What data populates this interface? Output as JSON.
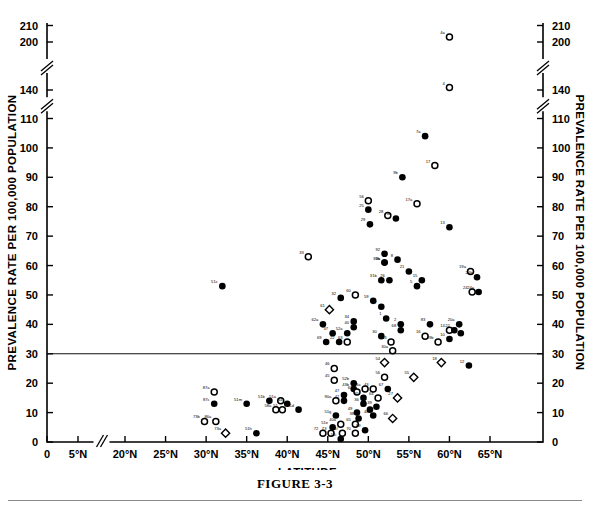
{
  "figure": {
    "caption": "FIGURE 3-3",
    "xlabel": "LATITUDE",
    "ylabel_left": "PREVALENCE RATE PER 100,000 POPULATION",
    "ylabel_right": "PREVALENCE RATE PER 100,000 POPULATION"
  },
  "chart_data": {
    "type": "scatter",
    "title": "FIGURE 3-3",
    "xlabel": "LATITUDE",
    "ylabel": "PREVALENCE RATE PER 100,000 POPULATION",
    "grid": false,
    "legend": null,
    "xtick_labels": [
      "0",
      "5°N",
      "20°N",
      "25°N",
      "30°N",
      "35°N",
      "40°N",
      "45°N",
      "50°N",
      "55°N",
      "60°N",
      "65°N"
    ],
    "xtick_values": [
      0,
      5,
      20,
      25,
      30,
      35,
      40,
      45,
      50,
      55,
      60,
      65
    ],
    "x_axis_break_between": [
      5,
      20
    ],
    "ytick_labels": [
      "0",
      "10",
      "20",
      "30",
      "40",
      "50",
      "60",
      "70",
      "80",
      "90",
      "100",
      "110",
      "140",
      "200",
      "210"
    ],
    "ytick_values": [
      0,
      10,
      20,
      30,
      40,
      50,
      60,
      70,
      80,
      90,
      100,
      110,
      140,
      200,
      210
    ],
    "y_axis_breaks": [
      [
        110,
        140
      ],
      [
        140,
        200
      ]
    ],
    "reference_line_y": 30,
    "marker_types": [
      "filled-circle",
      "open-circle",
      "open-diamond"
    ],
    "points": [
      {
        "label": "4a",
        "x": 60.0,
        "y": 203,
        "m": "open"
      },
      {
        "label": "4",
        "x": 60.0,
        "y": 143,
        "m": "open"
      },
      {
        "label": "7a",
        "x": 57.0,
        "y": 104,
        "m": "filled"
      },
      {
        "label": "17",
        "x": 58.2,
        "y": 94,
        "m": "open"
      },
      {
        "label": "9b",
        "x": 54.2,
        "y": 90,
        "m": "filled"
      },
      {
        "label": "56",
        "x": 50.0,
        "y": 82,
        "m": "open"
      },
      {
        "label": "17a",
        "x": 56.0,
        "y": 81,
        "m": "open"
      },
      {
        "label": "25",
        "x": 50.0,
        "y": 79,
        "m": "filled"
      },
      {
        "label": "28",
        "x": 52.4,
        "y": 77,
        "m": "open"
      },
      {
        "label": "4a",
        "x": 53.4,
        "y": 76,
        "m": "filled"
      },
      {
        "label": "29",
        "x": 50.2,
        "y": 74,
        "m": "filled"
      },
      {
        "label": "13",
        "x": 60.0,
        "y": 73,
        "m": "filled"
      },
      {
        "label": "33",
        "x": 42.6,
        "y": 63,
        "m": "open"
      },
      {
        "label": "9a",
        "x": 52.0,
        "y": 61,
        "m": "filled"
      },
      {
        "label": "30b",
        "x": 52.0,
        "y": 61,
        "m": "filled"
      },
      {
        "label": "92",
        "x": 52.0,
        "y": 64,
        "m": "filled"
      },
      {
        "label": "8",
        "x": 53.6,
        "y": 62,
        "m": "filled"
      },
      {
        "label": "19a",
        "x": 62.6,
        "y": 58,
        "m": "open"
      },
      {
        "label": "21",
        "x": 55.0,
        "y": 58,
        "m": "filled"
      },
      {
        "label": "24b",
        "x": 63.4,
        "y": 56,
        "m": "filled"
      },
      {
        "label": "31b",
        "x": 51.6,
        "y": 55,
        "m": "filled"
      },
      {
        "label": "26",
        "x": 52.6,
        "y": 55,
        "m": "filled"
      },
      {
        "label": "15",
        "x": 56.6,
        "y": 55,
        "m": "filled"
      },
      {
        "label": "5",
        "x": 56.0,
        "y": 53,
        "m": "filled"
      },
      {
        "label": "51c",
        "x": 32.0,
        "y": 53,
        "m": "filled"
      },
      {
        "label": "24",
        "x": 62.8,
        "y": 51,
        "m": "open"
      },
      {
        "label": "24a",
        "x": 63.6,
        "y": 51,
        "m": "filled"
      },
      {
        "label": "32",
        "x": 46.6,
        "y": 49,
        "m": "filled"
      },
      {
        "label": "60",
        "x": 48.4,
        "y": 50,
        "m": "open"
      },
      {
        "label": "59",
        "x": 50.6,
        "y": 48,
        "m": "filled"
      },
      {
        "label": "57",
        "x": 51.6,
        "y": 46,
        "m": "filled"
      },
      {
        "label": "61",
        "x": 45.2,
        "y": 45,
        "m": "dia"
      },
      {
        "label": "1",
        "x": 52.2,
        "y": 42,
        "m": "filled"
      },
      {
        "label": "62a",
        "x": 44.4,
        "y": 40,
        "m": "filled"
      },
      {
        "label": "34",
        "x": 48.2,
        "y": 41,
        "m": "filled"
      },
      {
        "label": "40",
        "x": 48.2,
        "y": 39,
        "m": "filled"
      },
      {
        "label": "2",
        "x": 54.0,
        "y": 40,
        "m": "filled"
      },
      {
        "label": "83",
        "x": 57.6,
        "y": 40,
        "m": "filled"
      },
      {
        "label": "20a",
        "x": 61.2,
        "y": 40,
        "m": "filled"
      },
      {
        "label": "37",
        "x": 45.6,
        "y": 37,
        "m": "filled"
      },
      {
        "label": "52a",
        "x": 47.4,
        "y": 37,
        "m": "filled"
      },
      {
        "label": "68",
        "x": 54.0,
        "y": 38,
        "m": "filled"
      },
      {
        "label": "14",
        "x": 60.0,
        "y": 38,
        "m": "open"
      },
      {
        "label": "22",
        "x": 60.6,
        "y": 38,
        "m": "filled"
      },
      {
        "label": "23",
        "x": 61.4,
        "y": 37,
        "m": "filled"
      },
      {
        "label": "16",
        "x": 57.0,
        "y": 36,
        "m": "open"
      },
      {
        "label": "30",
        "x": 51.6,
        "y": 36,
        "m": "filled"
      },
      {
        "label": "10",
        "x": 60.0,
        "y": 35,
        "m": "filled"
      },
      {
        "label": "53",
        "x": 52.8,
        "y": 34,
        "m": "open"
      },
      {
        "label": "69",
        "x": 44.8,
        "y": 34,
        "m": "filled"
      },
      {
        "label": "22",
        "x": 46.4,
        "y": 34,
        "m": "filled"
      },
      {
        "label": "63",
        "x": 47.4,
        "y": 34,
        "m": "open"
      },
      {
        "label": "19b",
        "x": 58.6,
        "y": 34,
        "m": "open"
      },
      {
        "label": "30a",
        "x": 53.0,
        "y": 31,
        "m": "open"
      },
      {
        "label": "54",
        "x": 52.0,
        "y": 27,
        "m": "dia"
      },
      {
        "label": "18",
        "x": 59.0,
        "y": 27,
        "m": "dia"
      },
      {
        "label": "12",
        "x": 62.4,
        "y": 26,
        "m": "filled"
      },
      {
        "label": "46",
        "x": 45.8,
        "y": 25,
        "m": "open"
      },
      {
        "label": "56",
        "x": 52.0,
        "y": 22,
        "m": "open"
      },
      {
        "label": "55",
        "x": 55.6,
        "y": 22,
        "m": "dia"
      },
      {
        "label": "45",
        "x": 45.8,
        "y": 21,
        "m": "open"
      },
      {
        "label": "52b",
        "x": 48.2,
        "y": 20,
        "m": "filled"
      },
      {
        "label": "43b",
        "x": 48.2,
        "y": 18,
        "m": "filled"
      },
      {
        "label": "87a",
        "x": 31.0,
        "y": 17,
        "m": "open"
      },
      {
        "label": "27",
        "x": 53.6,
        "y": 15,
        "m": "dia"
      },
      {
        "label": "87c",
        "x": 31.0,
        "y": 13,
        "m": "filled"
      },
      {
        "label": "51b",
        "x": 37.8,
        "y": 14,
        "m": "filled"
      },
      {
        "label": "51m",
        "x": 35.0,
        "y": 13,
        "m": "filled"
      },
      {
        "label": "51a",
        "x": 39.2,
        "y": 14,
        "m": "open"
      },
      {
        "label": "44",
        "x": 40.0,
        "y": 13,
        "m": "filled"
      },
      {
        "label": "58a",
        "x": 38.6,
        "y": 11,
        "m": "open"
      },
      {
        "label": "51",
        "x": 39.4,
        "y": 11,
        "m": "open"
      },
      {
        "label": "47",
        "x": 47.0,
        "y": 16,
        "m": "filled"
      },
      {
        "label": "42",
        "x": 47.0,
        "y": 14,
        "m": "filled"
      },
      {
        "label": "90a",
        "x": 46.0,
        "y": 14,
        "m": "open"
      },
      {
        "label": "62",
        "x": 48.6,
        "y": 17,
        "m": "open"
      },
      {
        "label": "43a",
        "x": 49.6,
        "y": 18,
        "m": "open"
      },
      {
        "label": "43",
        "x": 50.6,
        "y": 18,
        "m": "open"
      },
      {
        "label": "67",
        "x": 52.4,
        "y": 18,
        "m": "filled"
      },
      {
        "label": "64",
        "x": 51.2,
        "y": 15,
        "m": "open"
      },
      {
        "label": "35",
        "x": 49.4,
        "y": 15,
        "m": "filled"
      },
      {
        "label": "36",
        "x": 49.4,
        "y": 13,
        "m": "filled"
      },
      {
        "label": "39",
        "x": 51.0,
        "y": 12,
        "m": "filled"
      },
      {
        "label": "41",
        "x": 50.2,
        "y": 11,
        "m": "filled"
      },
      {
        "label": "48",
        "x": 50.6,
        "y": 9,
        "m": "filled"
      },
      {
        "label": "51d",
        "x": 41.4,
        "y": 11,
        "m": "filled"
      },
      {
        "label": "51g",
        "x": 46.0,
        "y": 9,
        "m": "filled"
      },
      {
        "label": "49",
        "x": 48.6,
        "y": 10,
        "m": "filled"
      },
      {
        "label": "38",
        "x": 48.8,
        "y": 8,
        "m": "filled"
      },
      {
        "label": "65",
        "x": 48.4,
        "y": 6,
        "m": "open"
      },
      {
        "label": "40a",
        "x": 46.6,
        "y": 6,
        "m": "open"
      },
      {
        "label": "66",
        "x": 53.0,
        "y": 8,
        "m": "dia"
      },
      {
        "label": "51e",
        "x": 45.6,
        "y": 5,
        "m": "filled"
      },
      {
        "label": "89",
        "x": 49.6,
        "y": 4,
        "m": "filled"
      },
      {
        "label": "70",
        "x": 48.4,
        "y": 3,
        "m": "open"
      },
      {
        "label": "51f",
        "x": 46.8,
        "y": 3,
        "m": "open"
      },
      {
        "label": "72",
        "x": 44.4,
        "y": 3,
        "m": "open"
      },
      {
        "label": "73",
        "x": 45.4,
        "y": 3,
        "m": "open"
      },
      {
        "label": "73b",
        "x": 29.8,
        "y": 7,
        "m": "open"
      },
      {
        "label": "86a",
        "x": 31.2,
        "y": 7,
        "m": "open"
      },
      {
        "label": "73a",
        "x": 32.4,
        "y": 3,
        "m": "dia"
      },
      {
        "label": "51h",
        "x": 36.2,
        "y": 3,
        "m": "filled"
      },
      {
        "label": "51i",
        "x": 46.6,
        "y": 1,
        "m": "filled"
      }
    ]
  }
}
